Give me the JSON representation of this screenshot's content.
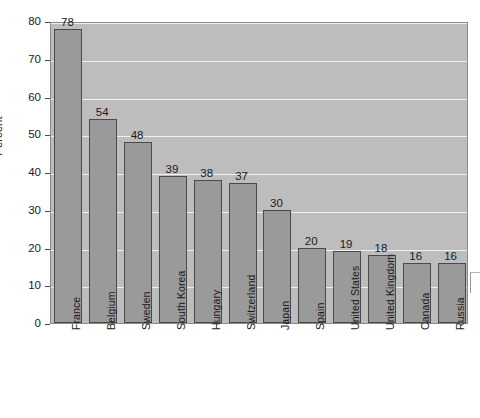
{
  "chart_data": {
    "type": "bar",
    "title": "",
    "xlabel": "",
    "ylabel": "Percent",
    "ylim": [
      0,
      80
    ],
    "ytick_step": 10,
    "yticks": [
      0,
      10,
      20,
      30,
      40,
      50,
      60,
      70,
      80
    ],
    "grid": true,
    "legend": null,
    "categories": [
      "France",
      "Belgium",
      "Sweden",
      "South Korea",
      "Hungary",
      "Switzerland",
      "Japan",
      "Spain",
      "United States",
      "United Kingdom",
      "Canada",
      "Russia"
    ],
    "values": [
      78,
      54,
      48,
      39,
      38,
      37,
      30,
      20,
      19,
      18,
      16,
      16
    ],
    "data_labels": [
      "78",
      "54",
      "48",
      "39",
      "38",
      "37",
      "30",
      "20",
      "19",
      "18",
      "16",
      "16"
    ],
    "colors": {
      "bar_fill": "#9a9a9a",
      "bar_border": "#4a4a4a",
      "plot_background": "#bdbdbd",
      "gridline": "#efefef",
      "page_background": "#ffffff",
      "text": "#1b1b1b"
    }
  }
}
